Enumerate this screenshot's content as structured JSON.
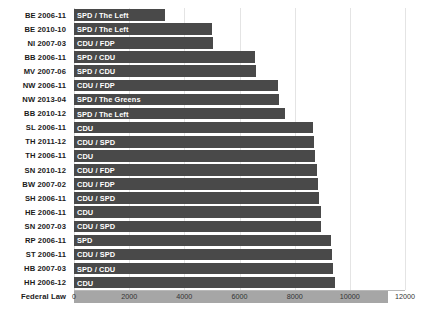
{
  "chart_data": {
    "type": "bar",
    "orientation": "horizontal",
    "title": "",
    "xlabel": "",
    "ylabel": "",
    "xlim": [
      0,
      12000
    ],
    "xticks": [
      0,
      2000,
      4000,
      6000,
      8000,
      10000,
      12000
    ],
    "xtick_labels": [
      "0",
      "2000",
      "4000",
      "6000",
      "8000",
      "10000",
      "12000"
    ],
    "grid": true,
    "legend": "none",
    "bar_color": "#494949",
    "highlight_color": "#a6a6a6",
    "categories": [
      "BE 2006-11",
      "BE 2010-10",
      "NI 2007-03",
      "BB 2006-11",
      "MV 2007-06",
      "NW 2006-11",
      "NW 2013-04",
      "BB 2010-12",
      "SL 2006-11",
      "TH 2011-12",
      "TH 2006-11",
      "SN 2010-12",
      "BW 2007-02",
      "SH 2006-11",
      "HE 2006-11",
      "SN 2007-03",
      "RP 2006-11",
      "ST 2006-11",
      "HB 2007-03",
      "HH 2006-12",
      "Federal Law"
    ],
    "values": [
      3300,
      5000,
      5050,
      6550,
      6600,
      7400,
      7450,
      7650,
      8650,
      8700,
      8750,
      8800,
      8850,
      8900,
      8950,
      8950,
      9300,
      9350,
      9400,
      9450,
      11400
    ],
    "bar_annotations": [
      "SPD / The Left",
      "SPD / The Left",
      "CDU / FDP",
      "SPD / CDU",
      "SPD / CDU",
      "CDU / FDP",
      "SPD / The Greens",
      "SPD / The Left",
      "CDU",
      "CDU / SPD",
      "CDU",
      "CDU / FDP",
      "CDU / FDP",
      "CDU / SPD",
      "CDU",
      "CDU / SPD",
      "SPD",
      "CDU / SPD",
      "SPD / CDU",
      "CDU",
      ""
    ],
    "highlight_index": 20
  }
}
